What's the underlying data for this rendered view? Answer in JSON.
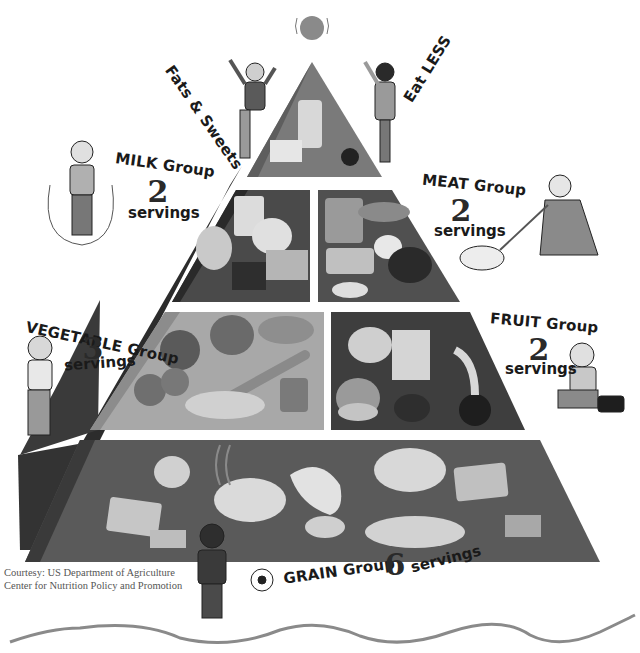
{
  "diagram": {
    "tiers": [
      {
        "id": "fats",
        "label": "Fats & Sweets",
        "sub_label": "Eat LESS",
        "items": [
          "soda can",
          "butter",
          "candy",
          "tape measure"
        ]
      },
      {
        "id": "milk",
        "label": "MILK Group",
        "servings": "2",
        "servings_word": "servings",
        "items": [
          "glass of milk",
          "yogurt",
          "ice cream",
          "cheese"
        ]
      },
      {
        "id": "meat",
        "label": "MEAT Group",
        "servings": "2",
        "servings_word": "servings",
        "items": [
          "peanut butter",
          "tuna can",
          "chicken leg",
          "eggs",
          "beans",
          "ground meat"
        ]
      },
      {
        "id": "vegetable",
        "label": "VEGETABLE Group",
        "servings": "3",
        "servings_word": "servings",
        "items": [
          "tomato",
          "spinach",
          "potato",
          "carrot",
          "broccoli",
          "green beans",
          "peas"
        ]
      },
      {
        "id": "fruit",
        "label": "FRUIT Group",
        "servings": "2",
        "servings_word": "servings",
        "items": [
          "fruit cup",
          "fruit juice",
          "orange",
          "banana",
          "raisins",
          "apple"
        ]
      },
      {
        "id": "grain",
        "label": "GRAIN Group",
        "servings": "6",
        "servings_word": "servings",
        "items": [
          "waffle",
          "rice",
          "crackers",
          "pasta bowl",
          "tortilla",
          "english muffin",
          "cereal",
          "spaghetti",
          "bread"
        ]
      }
    ],
    "credit": {
      "line1": "Courtesy: US Department of Agriculture",
      "line2": "Center for Nutrition Policy and Promotion"
    },
    "colors": {
      "tier_dark": "#4a4a4a",
      "tier_medium": "#6e6e6e",
      "tier_light": "#a8a8a8",
      "side_dark": "#2c2c2c",
      "wave": "#8a8a8a"
    }
  }
}
